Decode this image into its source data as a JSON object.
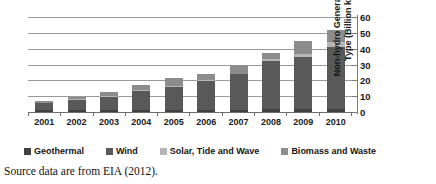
{
  "chart_data": {
    "type": "bar",
    "stacked": true,
    "title": "",
    "xlabel": "",
    "ylabel": "Non-hydro Generation by Type (Billion kWh)",
    "categories": [
      "2001",
      "2002",
      "2003",
      "2004",
      "2005",
      "2006",
      "2007",
      "2008",
      "2009",
      "2010"
    ],
    "series": [
      {
        "name": "Geothermal",
        "color": "#404040",
        "values": [
          1.3,
          1.4,
          1.4,
          1.4,
          1.5,
          1.5,
          1.5,
          1.6,
          1.6,
          1.6
        ]
      },
      {
        "name": "Wind",
        "color": "#595959",
        "values": [
          4.2,
          6.2,
          8.4,
          11.9,
          14.6,
          18.1,
          22.2,
          30.9,
          33.3,
          39.4
        ]
      },
      {
        "name": "Solar, Tide and Wave",
        "color": "#b5b5b5",
        "values": [
          0.4,
          0.5,
          0.5,
          0.5,
          0.5,
          0.5,
          0.6,
          0.8,
          1.9,
          3.2
        ]
      },
      {
        "name": "Biomass and Waste",
        "color": "#8c8c8c",
        "values": [
          1.1,
          1.4,
          2.2,
          3.0,
          5.0,
          3.8,
          5.4,
          4.1,
          7.8,
          7.4
        ]
      }
    ],
    "ylim": [
      0,
      60
    ],
    "yticks": [
      0,
      10,
      20,
      30,
      40,
      50,
      60
    ],
    "ytick_labels": [
      "0",
      "10",
      "20",
      "30",
      "40",
      "50",
      "60"
    ],
    "gridlines": true,
    "grid_axis": "y",
    "legend_position": "bottom",
    "y_axis_position": "right"
  },
  "axis": {
    "y_title_line1": "Non-hydro Generation by",
    "y_title_line2": "Type (Billion kWh)"
  },
  "caption": {
    "text": "Source data are from EIA (2012)."
  }
}
